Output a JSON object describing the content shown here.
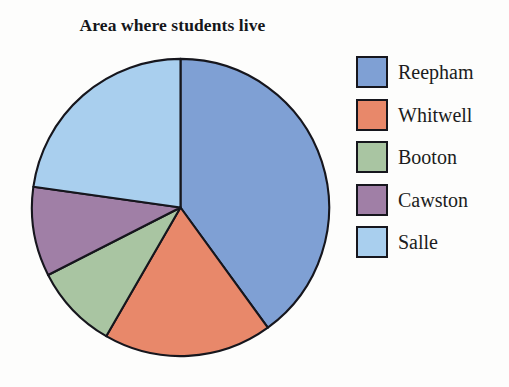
{
  "chart_data": {
    "type": "pie",
    "title": "Area where students live",
    "categories": [
      "Reepham",
      "Whitwell",
      "Booton",
      "Cawston",
      "Salle"
    ],
    "values": [
      40,
      18,
      9,
      10,
      23
    ],
    "unit": "percent",
    "angles_deg": [
      144,
      66,
      33,
      35,
      82
    ],
    "start_angle_deg": 0,
    "direction": "clockwise",
    "colors": [
      "#7fa0d4",
      "#e8886a",
      "#a9c5a2",
      "#a07fa6",
      "#a9cfee"
    ],
    "slice_border_color": "#16161d",
    "legend_position": "right",
    "grid": false,
    "xlabel": "",
    "ylabel": ""
  },
  "title": {
    "text": "Area where students live"
  },
  "legend": {
    "items": [
      {
        "label": "Reepham",
        "color": "#7fa0d4"
      },
      {
        "label": "Whitwell",
        "color": "#e8886a"
      },
      {
        "label": "Booton",
        "color": "#a9c5a2"
      },
      {
        "label": "Cawston",
        "color": "#a07fa6"
      },
      {
        "label": "Salle",
        "color": "#a9cfee"
      }
    ]
  }
}
